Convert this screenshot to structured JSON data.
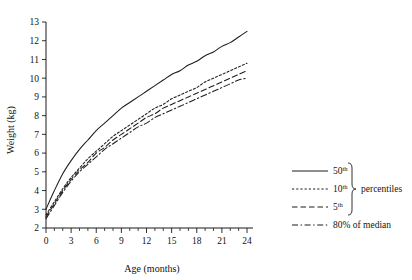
{
  "chart_data": {
    "type": "line",
    "title": "",
    "xlabel": "Age (months)",
    "ylabel": "Weight (kg)",
    "xlim": [
      0,
      24
    ],
    "ylim": [
      2,
      13
    ],
    "grid": false,
    "legend_position": "right",
    "x_ticks_major": [
      0,
      3,
      6,
      9,
      12,
      15,
      18,
      21,
      24
    ],
    "x_tick_labels": [
      "0",
      "3",
      "6",
      "9",
      "12",
      "15",
      "18",
      "21",
      "24"
    ],
    "x_ticks_minor": [
      1,
      2,
      4,
      5,
      7,
      8,
      10,
      11,
      13,
      14,
      16,
      17,
      19,
      20,
      22,
      23
    ],
    "y_ticks_major": [
      2,
      3,
      4,
      5,
      6,
      7,
      8,
      9,
      10,
      11,
      12,
      13
    ],
    "y_tick_labels": [
      "2",
      "3",
      "4",
      "5",
      "6",
      "7",
      "8",
      "9",
      "10",
      "11",
      "12",
      "13"
    ],
    "x": [
      0,
      1,
      2,
      3,
      4,
      5,
      6,
      7,
      8,
      9,
      10,
      11,
      12,
      13,
      14,
      15,
      16,
      17,
      18,
      19,
      20,
      21,
      22,
      23,
      24
    ],
    "series": [
      {
        "name": "50th",
        "style": "solid",
        "values": [
          3.0,
          4.0,
          4.9,
          5.6,
          6.2,
          6.7,
          7.2,
          7.6,
          8.0,
          8.4,
          8.7,
          9.0,
          9.3,
          9.6,
          9.9,
          10.2,
          10.4,
          10.7,
          10.9,
          11.2,
          11.4,
          11.7,
          11.9,
          12.2,
          12.5
        ]
      },
      {
        "name": "10th",
        "style": "dotted",
        "values": [
          2.7,
          3.4,
          4.1,
          4.7,
          5.2,
          5.7,
          6.1,
          6.5,
          6.9,
          7.2,
          7.5,
          7.8,
          8.1,
          8.4,
          8.6,
          8.9,
          9.1,
          9.3,
          9.5,
          9.8,
          10.0,
          10.2,
          10.4,
          10.6,
          10.8
        ]
      },
      {
        "name": "5th",
        "style": "dashed",
        "values": [
          2.6,
          3.3,
          4.0,
          4.6,
          5.1,
          5.5,
          6.0,
          6.3,
          6.7,
          7.0,
          7.3,
          7.6,
          7.9,
          8.1,
          8.4,
          8.6,
          8.8,
          9.0,
          9.2,
          9.4,
          9.6,
          9.8,
          10.0,
          10.2,
          10.4
        ]
      },
      {
        "name": "80% of median",
        "style": "dashdot",
        "values": [
          2.5,
          3.2,
          3.9,
          4.5,
          5.0,
          5.4,
          5.8,
          6.2,
          6.5,
          6.8,
          7.1,
          7.4,
          7.6,
          7.9,
          8.1,
          8.3,
          8.5,
          8.7,
          8.9,
          9.1,
          9.3,
          9.5,
          9.7,
          9.9,
          10.0
        ]
      }
    ],
    "legend": [
      {
        "label_base": "50",
        "label_sup": "th",
        "style": "solid"
      },
      {
        "label_base": "10",
        "label_sup": "th",
        "style": "dotted"
      },
      {
        "label_base": "5",
        "label_sup": "th",
        "style": "dashed"
      },
      {
        "label_base": "80% of median",
        "label_sup": "",
        "style": "dashdot"
      }
    ],
    "legend_group_label": "percentiles"
  },
  "colors": {
    "ink": "#1c1c1c",
    "background": "#ffffff"
  }
}
